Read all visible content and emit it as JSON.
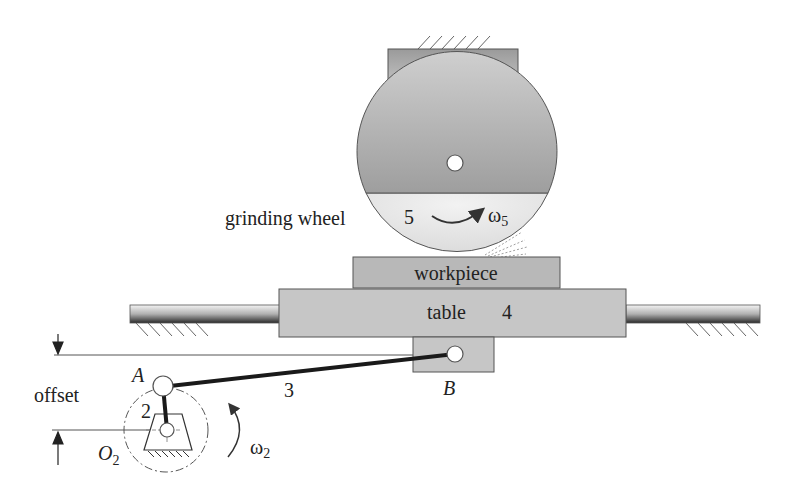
{
  "diagram": {
    "type": "mechanism",
    "labels": {
      "grinding_wheel": "grinding wheel",
      "wheel_number": "5",
      "omega5": "ω",
      "omega5_sub": "5",
      "workpiece": "workpiece",
      "table": "table",
      "table_number": "4",
      "link3": "3",
      "pointB": "B",
      "pointA": "A",
      "link2": "2",
      "offset": "offset",
      "O": "O",
      "O_sub": "2",
      "omega2": "ω",
      "omega2_sub": "2"
    },
    "colors": {
      "wheel_dark": "#a8a8a8",
      "wheel_light": "#e6e6e6",
      "block": "#c4c4c4",
      "rod_dark": "#2a2a2a",
      "outline": "#555555"
    }
  }
}
